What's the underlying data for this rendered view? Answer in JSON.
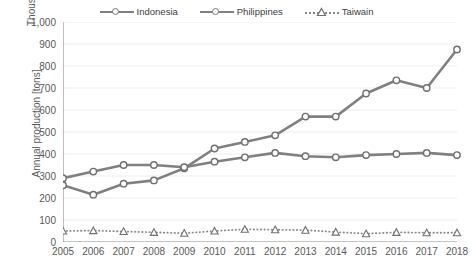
{
  "chart_data": {
    "type": "line",
    "title": "",
    "xlabel": "",
    "ylabel": "Annual production [tons]",
    "unit_label": "Thousands",
    "grid": true,
    "legend_position": "top",
    "ylim": [
      0,
      1000
    ],
    "ytick_step": 100,
    "yticks": [
      "0",
      "100",
      "200",
      "300",
      "400",
      "500",
      "600",
      "700",
      "800",
      "900",
      "1,000"
    ],
    "categories": [
      2005,
      2006,
      2007,
      2008,
      2009,
      2010,
      2011,
      2012,
      2013,
      2014,
      2015,
      2016,
      2017,
      2018
    ],
    "xticks": [
      "2005",
      "2006",
      "2007",
      "2008",
      "2009",
      "2010",
      "2011",
      "2012",
      "2013",
      "2014",
      "2015",
      "2016",
      "2017",
      "2018"
    ],
    "series": [
      {
        "name": "Indonesia",
        "color": "#808080",
        "marker": "circle",
        "linestyle": "solid",
        "values": [
          258,
          215,
          265,
          280,
          335,
          425,
          455,
          485,
          570,
          570,
          675,
          735,
          700,
          875
        ]
      },
      {
        "name": "Philippines",
        "color": "#808080",
        "marker": "circle",
        "linestyle": "solid",
        "values": [
          290,
          320,
          350,
          350,
          340,
          365,
          385,
          405,
          390,
          385,
          395,
          400,
          405,
          395
        ]
      },
      {
        "name": "Taiwain",
        "color": "#8a8a8a",
        "marker": "triangle",
        "linestyle": "dotted",
        "values": [
          50,
          52,
          48,
          44,
          40,
          50,
          58,
          56,
          54,
          45,
          38,
          44,
          42,
          42
        ]
      }
    ]
  },
  "legend": {
    "items": [
      {
        "label": "Indonesia"
      },
      {
        "label": "Philippines"
      },
      {
        "label": "Taiwain"
      }
    ]
  },
  "axes": {
    "y_title": "Annual production [tons]",
    "y_unit": "Thousands"
  },
  "colors": {
    "line": "#808080",
    "dotted": "#8a8a8a",
    "grid": "#e8e8e8",
    "axis": "#8c8c8c",
    "text": "#595959"
  }
}
